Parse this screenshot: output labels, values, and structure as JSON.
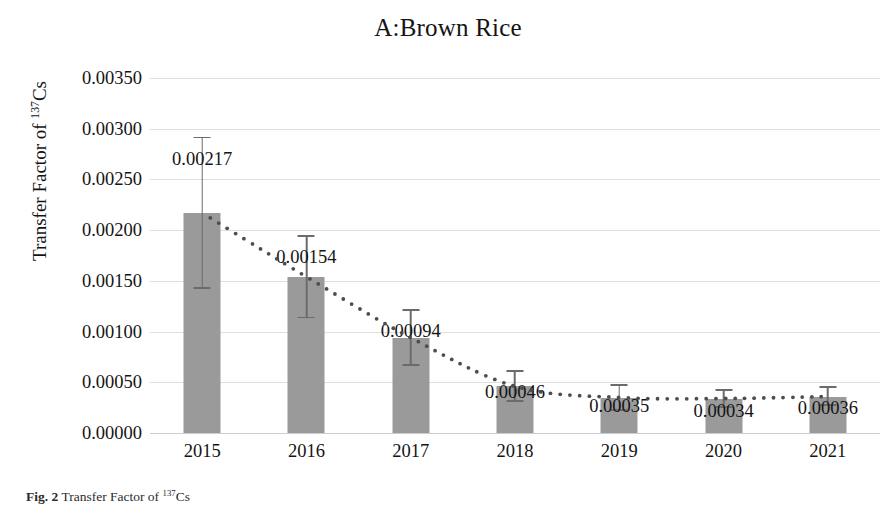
{
  "chart_data": {
    "type": "bar",
    "title": "A:Brown Rice",
    "xlabel": "",
    "ylabel": "Transfer Factor of 137Cs",
    "ylabel_prefix": "Transfer Factor of ",
    "ylabel_sup": "137",
    "ylabel_suffix": "Cs",
    "categories": [
      "2015",
      "2016",
      "2017",
      "2018",
      "2019",
      "2020",
      "2021"
    ],
    "values": [
      0.00217,
      0.00154,
      0.00094,
      0.00046,
      0.00035,
      0.00034,
      0.00036
    ],
    "value_labels": [
      "0.00217",
      "0.00154",
      "0.00094",
      "0.00046",
      "0.00035",
      "0.00034",
      "0.00036"
    ],
    "error_high": [
      0.00292,
      0.00195,
      0.00122,
      0.00062,
      0.00048,
      0.00043,
      0.00046
    ],
    "error_low": [
      0.00142,
      0.00113,
      0.00066,
      0.00031,
      0.00022,
      0.00025,
      0.00027
    ],
    "ylim": [
      0.0,
      0.0035
    ],
    "yticks": [
      0.0,
      0.0005,
      0.001,
      0.0015,
      0.002,
      0.0025,
      0.003,
      0.0035
    ],
    "ytick_labels": [
      "0.00000",
      "0.00050",
      "0.00100",
      "0.00150",
      "0.00200",
      "0.00250",
      "0.00300",
      "0.00350"
    ],
    "grid": true,
    "legend": "none",
    "legend_position": "none",
    "series": [
      {
        "name": "Transfer Factor",
        "style": "bar",
        "color": "#9a9a9a",
        "values": [
          0.00217,
          0.00154,
          0.00094,
          0.00046,
          0.00035,
          0.00034,
          0.00036
        ]
      },
      {
        "name": "Trend",
        "style": "dotted-line",
        "color": "#4d4d4d",
        "values": [
          0.00217,
          0.00154,
          0.00094,
          0.00046,
          0.00035,
          0.00034,
          0.00036
        ]
      }
    ]
  },
  "caption": {
    "text": "Fig. 2 Transfer Factor of 137Cs"
  }
}
